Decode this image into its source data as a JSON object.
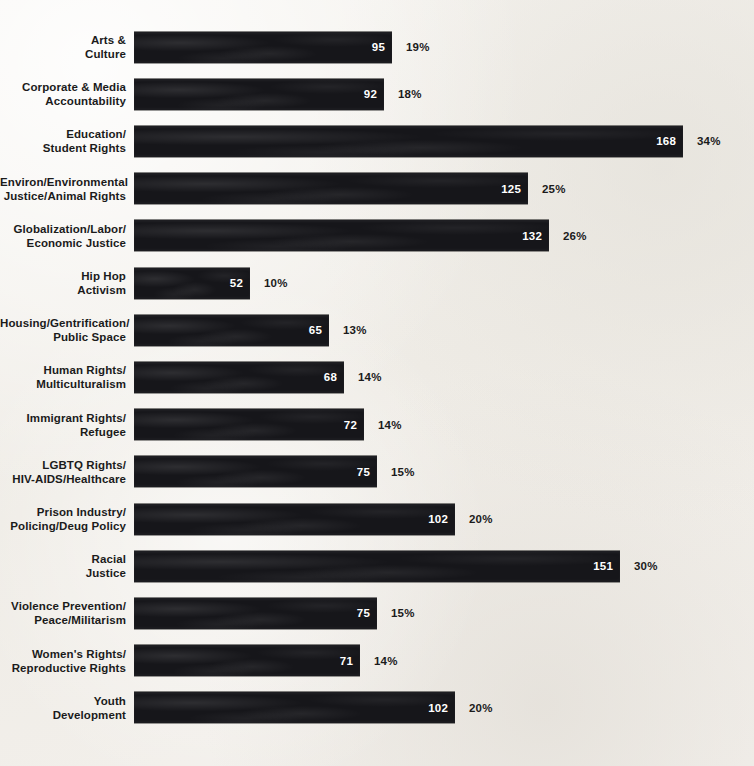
{
  "chart_data": {
    "type": "bar",
    "orientation": "horizontal",
    "title": "",
    "subtitle": "",
    "xlabel": "",
    "ylabel": "",
    "grid": false,
    "legend": null,
    "axis_visible": false,
    "value_label_position": "inside-right",
    "bar_color": "#16161a",
    "value_label_color": "#ffffff",
    "percent_label_color": "#1b1b1b",
    "background_color": "#f2f0ec",
    "xlim": [
      0,
      168
    ],
    "categories": [
      "Arts &\nCulture",
      "Corporate & Media\nAccountability",
      "Education/\nStudent Rights",
      "Environ/Environmental\nJustice/Animal Rights",
      "Globalization/Labor/\nEconomic Justice",
      "Hip Hop\nActivism",
      "Housing/Gentrification/\nPublic Space",
      "Human Rights/\nMulticulturalism",
      "Immigrant Rights/\nRefugee",
      "LGBTQ Rights/\nHIV-AIDS/Healthcare",
      "Prison Industry/\nPolicing/Deug Policy",
      "Racial\nJustice",
      "Violence Prevention/\nPeace/Militarism",
      "Women's Rights/\nReproductive Rights",
      "Youth\nDevelopment"
    ],
    "values": [
      95,
      92,
      168,
      125,
      132,
      52,
      65,
      68,
      72,
      75,
      102,
      151,
      75,
      71,
      102
    ],
    "percents": [
      "19%",
      "18%",
      "34%",
      "25%",
      "26%",
      "10%",
      "13%",
      "14%",
      "14%",
      "15%",
      "20%",
      "30%",
      "15%",
      "14%",
      "20%"
    ],
    "bar_pixel_widths": [
      258,
      250,
      549,
      394,
      415,
      116,
      195,
      210,
      230,
      243,
      321,
      486,
      243,
      226,
      321
    ]
  },
  "rows": [
    {
      "label": "Arts &\nCulture",
      "value": "95",
      "percent": "19%",
      "width": 258
    },
    {
      "label": "Corporate & Media\nAccountability",
      "value": "92",
      "percent": "18%",
      "width": 250
    },
    {
      "label": "Education/\nStudent Rights",
      "value": "168",
      "percent": "34%",
      "width": 549
    },
    {
      "label": "Environ/Environmental\nJustice/Animal Rights",
      "value": "125",
      "percent": "25%",
      "width": 394
    },
    {
      "label": "Globalization/Labor/\nEconomic Justice",
      "value": "132",
      "percent": "26%",
      "width": 415
    },
    {
      "label": "Hip Hop\nActivism",
      "value": "52",
      "percent": "10%",
      "width": 116
    },
    {
      "label": "Housing/Gentrification/\nPublic Space",
      "value": "65",
      "percent": "13%",
      "width": 195
    },
    {
      "label": "Human Rights/\nMulticulturalism",
      "value": "68",
      "percent": "14%",
      "width": 210
    },
    {
      "label": "Immigrant Rights/\nRefugee",
      "value": "72",
      "percent": "14%",
      "width": 230
    },
    {
      "label": "LGBTQ Rights/\nHIV-AIDS/Healthcare",
      "value": "75",
      "percent": "15%",
      "width": 243
    },
    {
      "label": "Prison Industry/\nPolicing/Deug Policy",
      "value": "102",
      "percent": "20%",
      "width": 321
    },
    {
      "label": "Racial\nJustice",
      "value": "151",
      "percent": "30%",
      "width": 486
    },
    {
      "label": "Violence Prevention/\nPeace/Militarism",
      "value": "75",
      "percent": "15%",
      "width": 243
    },
    {
      "label": "Women's Rights/\nReproductive Rights",
      "value": "71",
      "percent": "14%",
      "width": 226
    },
    {
      "label": "Youth\nDevelopment",
      "value": "102",
      "percent": "20%",
      "width": 321
    }
  ]
}
